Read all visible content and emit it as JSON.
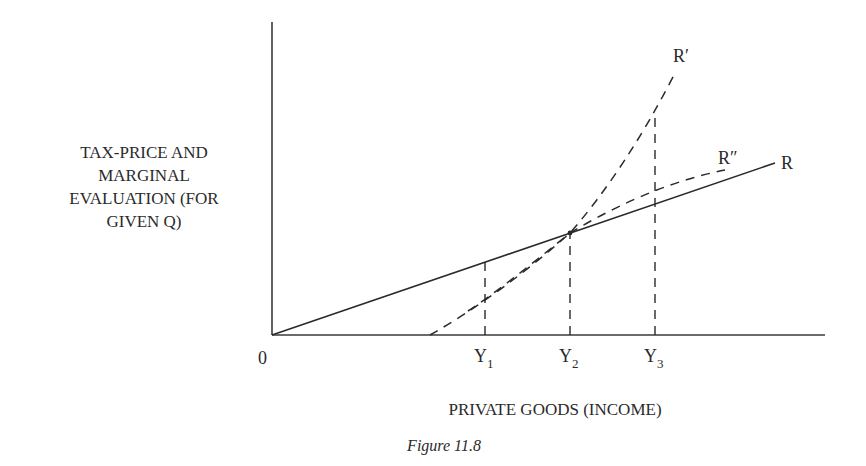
{
  "diagram": {
    "y_axis_label_lines": [
      "TAX-PRICE AND",
      "MARGINAL",
      "EVALUATION (FOR",
      "GIVEN Q)"
    ],
    "x_axis_label": "PRIVATE GOODS (INCOME)",
    "origin_label": "0",
    "caption": "Figure 11.8",
    "ticks": [
      {
        "base": "Y",
        "sub": "1"
      },
      {
        "base": "Y",
        "sub": "2"
      },
      {
        "base": "Y",
        "sub": "3"
      }
    ],
    "curves": [
      {
        "label": "R",
        "style": "solid",
        "description": "straight line from origin"
      },
      {
        "label": "R′",
        "style": "dashed",
        "description": "steeper curve crossing R at Y2"
      },
      {
        "label": "R″",
        "style": "dashed",
        "description": "flatter curve crossing R at Y2"
      }
    ]
  }
}
